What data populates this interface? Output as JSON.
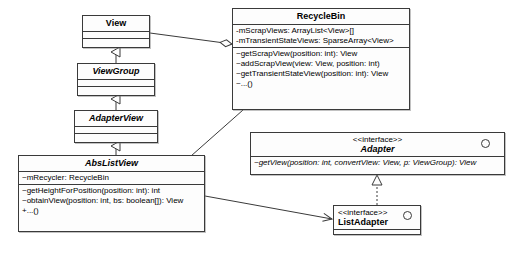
{
  "diagram": {
    "kind": "uml-class-diagram",
    "background": "#ffffff",
    "line_color": "#3a3a3a"
  },
  "classes": {
    "view": {
      "name": "View",
      "stereotype": "",
      "abstract": false,
      "attributes": [],
      "operations": []
    },
    "view_group": {
      "name": "ViewGroup",
      "stereotype": "",
      "abstract": true,
      "attributes": [],
      "operations": []
    },
    "adapter_view": {
      "name": "AdapterView",
      "stereotype": "",
      "abstract": true,
      "attributes": [],
      "operations": []
    },
    "abs_list_view": {
      "name": "AbsListView",
      "stereotype": "",
      "abstract": true,
      "attributes": [
        "~mRecycler: RecycleBin"
      ],
      "operations": [
        "~getHeightForPosition(position: int): int",
        "~obtainView(position: int, bs: boolean[]): View",
        "+...()"
      ]
    },
    "recycle_bin": {
      "name": "RecycleBin",
      "stereotype": "",
      "abstract": false,
      "attributes": [
        "-mScrapViews: ArrayList<View>[]",
        "-mTransientStateViews: SparseArray<View>"
      ],
      "operations": [
        "~getScrapView(position: int): View",
        "~addScrapView(view: View, position: int)",
        "~getTransientStateView(position: int): View",
        "~...()"
      ]
    },
    "adapter": {
      "name": "Adapter",
      "stereotype": "<<interface>>",
      "abstract": true,
      "attributes": [],
      "operations": [
        "~getView(position: int, convertView: View, p: ViewGroup): View"
      ]
    },
    "list_adapter": {
      "name": "ListAdapter",
      "stereotype": "<<interface>>",
      "abstract": false,
      "attributes": [],
      "operations": []
    }
  },
  "relationships": [
    {
      "id": "gen-viewgroup-view",
      "type": "generalization",
      "from": "ViewGroup",
      "to": "View"
    },
    {
      "id": "gen-adapterview-viewgroup",
      "type": "generalization",
      "from": "AdapterView",
      "to": "ViewGroup"
    },
    {
      "id": "gen-abslistview-adapterview",
      "type": "generalization",
      "from": "AbsListView",
      "to": "AdapterView"
    },
    {
      "id": "agg-recyclebin-view",
      "type": "aggregation",
      "from": "RecycleBin",
      "to": "View"
    },
    {
      "id": "assoc-abslistview-recyclebin",
      "type": "association",
      "from": "AbsListView",
      "to": "RecycleBin"
    },
    {
      "id": "assoc-abslistview-listadapter",
      "type": "directed-association",
      "from": "AbsListView",
      "to": "ListAdapter"
    },
    {
      "id": "real-listadapter-adapter",
      "type": "realization",
      "from": "ListAdapter",
      "to": "Adapter"
    }
  ],
  "icons": {
    "interface_circle": "interface-circle-icon",
    "generalization_arrow": "hollow-triangle-arrow-icon",
    "aggregation_diamond": "hollow-diamond-icon",
    "open_arrow": "open-arrow-icon"
  }
}
